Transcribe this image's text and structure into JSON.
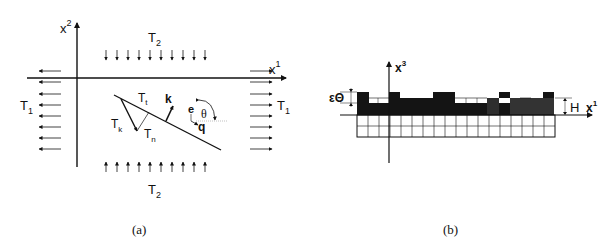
{
  "panel_a": {
    "caption": "(a)",
    "axis_vertical_label": "x",
    "axis_vertical_sup": "2",
    "axis_horizontal_label": "x",
    "axis_horizontal_sup": "1",
    "top_load_label": "T",
    "top_load_sub": "2",
    "bottom_load_label": "T",
    "bottom_load_sub": "2",
    "left_load_label": "T",
    "left_load_sub": "1",
    "right_load_label": "T",
    "right_load_sub": "1",
    "traction_tangent_label": "T",
    "traction_tangent_sub": "t",
    "traction_total_label": "T",
    "traction_total_sub": "k",
    "traction_normal_label": "T",
    "traction_normal_sub": "n",
    "normal_vector_label": "k",
    "direction_e_label": "e",
    "direction_q_label": "q",
    "angle_label": "θ"
  },
  "panel_b": {
    "caption": "(b)",
    "axis_vertical_label": "x",
    "axis_vertical_sup": "3",
    "axis_horizontal_label": "x",
    "axis_horizontal_sup": "1",
    "roughness_label": "εΘ",
    "height_label": "H",
    "grid_columns": 18,
    "grid_rows": 2
  },
  "colors": {
    "ink": "#111111",
    "fill_dark": "#141414",
    "fill_grey": "#3a3a3a",
    "background": "#ffffff"
  }
}
